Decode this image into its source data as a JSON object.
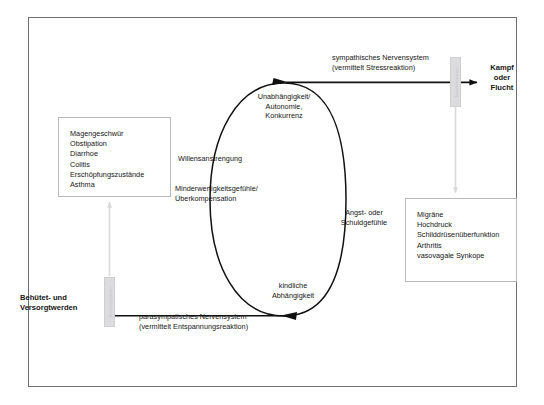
{
  "diagram": {
    "frame_border_color": "#6e6e72",
    "accent_grey": "#dcdcde"
  },
  "boxes": {
    "left": {
      "name": "parasympathetic-symptoms-box",
      "text": "Magengeschwür\nObstipation\nDiarrhoe\nColitis\nErschöpfungszustände\nAsthma",
      "items": [
        "Magengeschwür",
        "Obstipation",
        "Diarrhoe",
        "Colitis",
        "Erschöpfungszustände",
        "Asthma"
      ]
    },
    "right": {
      "name": "sympathetic-symptoms-box",
      "text": "Migräne\nHochdruck\nSchilddrüsenüberfunktion\nArthritis\nvasovagale Synkope",
      "items": [
        "Migräne",
        "Hochdruck",
        "Schilddrüsenüberfunktion",
        "Arthritis",
        "vasovagale Synkope"
      ]
    }
  },
  "labels": {
    "sympathetic_nerve": "sympathisches Nervensystem\n(vermittelt Stressreaktion)",
    "parasympathetic_nerve": "parasympatisches Nervensystem\n(vermittelt Entspannungsreaktion)",
    "kampf_oder_flucht": "Kampf\noder\nFlucht",
    "behuetet_versorgt": "Behütet- und\nVersorgtwerden"
  },
  "cycle": {
    "top": "Unabhängigkeit/\nAutonomie,\nKonkurrenz",
    "left_upper": "Willensanstrengung",
    "left_lower": "Minderwertigkeitsgefühle/\nÜberkompensation",
    "right": "Angst- oder\nSchuldgefühle",
    "bottom": "kindliche\nAbhängigkeit"
  },
  "bars": {
    "top_bar_text": "Nervensystem",
    "bottom_bar_text": "Nervensystem"
  }
}
